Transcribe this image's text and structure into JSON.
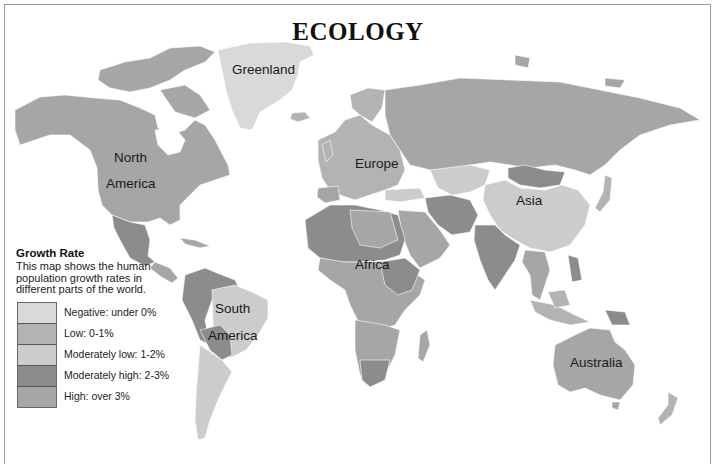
{
  "title": "ECOLOGY",
  "colors": {
    "negative": "#d9d9d9",
    "low": "#b3b3b3",
    "moderately_low": "#cccccc",
    "moderately_high": "#8c8c8c",
    "high": "#a6a6a6",
    "ocean": "#ffffff",
    "frame": "#9a9a9a"
  },
  "labels": {
    "greenland": "Greenland",
    "north_1": "North",
    "north_2": "America",
    "europe": "Europe",
    "asia": "Asia",
    "africa": "Africa",
    "south_1": "South",
    "south_2": "America",
    "australia": "Australia"
  },
  "legend": {
    "title": "Growth Rate",
    "description": "This map shows the human population growth rates in different parts of the world.",
    "items": [
      {
        "label": "Negative: under 0%",
        "key": "negative"
      },
      {
        "label": "Low: 0-1%",
        "key": "low"
      },
      {
        "label": "Moderately low: 1-2%",
        "key": "moderately_low"
      },
      {
        "label": "Moderately high: 2-3%",
        "key": "moderately_high"
      },
      {
        "label": "High: over 3%",
        "key": "high"
      }
    ]
  }
}
